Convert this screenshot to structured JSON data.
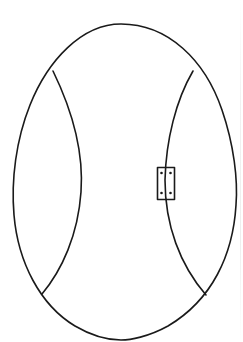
{
  "diagram": {
    "title": "",
    "colors": {
      "background": "#ffffff",
      "stroke": "#1a1a1a"
    },
    "parts": [
      {
        "id": "outer-shell",
        "shape": "egg outline"
      },
      {
        "id": "left-seam",
        "shape": "curved line"
      },
      {
        "id": "right-seam",
        "shape": "curved line"
      },
      {
        "id": "clasp",
        "shape": "rectangle with four dots"
      }
    ],
    "labels": []
  }
}
